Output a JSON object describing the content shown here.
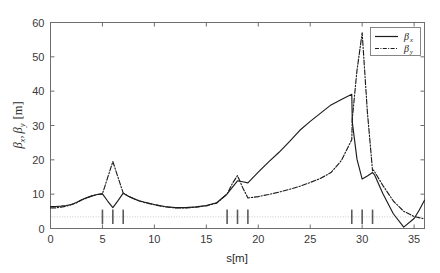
{
  "chart_data": {
    "type": "line",
    "title": "",
    "xlabel": "s[m]",
    "ylabel": "βx, βy [m]",
    "ylabel_parts": {
      "beta": "β",
      "sub_x": "x",
      "sub_y": "y",
      "unit": "[m]",
      "separator": ","
    },
    "xlim": [
      0,
      36
    ],
    "ylim": [
      0,
      60
    ],
    "xticks": [
      0,
      5,
      10,
      15,
      20,
      25,
      30,
      35
    ],
    "xtick_labels": [
      "0",
      "5",
      "10",
      "15",
      "20",
      "25",
      "30",
      "35"
    ],
    "yticks": [
      0,
      10,
      20,
      30,
      40,
      50,
      60
    ],
    "ytick_labels": [
      "0",
      "10",
      "20",
      "30",
      "40",
      "50",
      "60"
    ],
    "grid": false,
    "legend_position": "top-right",
    "legend": [
      {
        "name": "βx",
        "base": "β",
        "sub": "x",
        "style": "solid"
      },
      {
        "name": "βy",
        "base": "β",
        "sub": "y",
        "style": "dash-dot"
      }
    ],
    "reference_line": {
      "y": 3.4,
      "style": "dotted",
      "color": "#c4c4c4"
    },
    "lattice_markers": {
      "label": "magnet-elements",
      "y_center": 3.4,
      "half_height": 2.1,
      "positions": [
        5.0,
        6.0,
        7.0,
        17.0,
        18.0,
        19.0,
        29.0,
        30.0,
        31.0
      ]
    },
    "series": [
      {
        "name": "βx",
        "style": "solid",
        "x": [
          0.0,
          0.5,
          1.0,
          1.5,
          2.0,
          2.5,
          3.0,
          3.5,
          4.0,
          4.5,
          5.0,
          5.5,
          6.0,
          6.5,
          7.0,
          7.5,
          8.0,
          8.5,
          9.0,
          10.0,
          11.0,
          12.0,
          13.0,
          14.0,
          15.0,
          16.0,
          17.0,
          17.5,
          18.0,
          18.5,
          19.0,
          20.0,
          21.0,
          22.0,
          23.0,
          24.0,
          25.0,
          26.0,
          27.0,
          28.0,
          29.0,
          29.05,
          29.5,
          30.0,
          30.5,
          31.0,
          31.2,
          32.0,
          33.0,
          34.0,
          35.0,
          35.5,
          36.0
        ],
        "y": [
          6.4,
          6.4,
          6.5,
          6.7,
          7.0,
          7.6,
          8.4,
          9.0,
          9.5,
          9.9,
          10.1,
          8.0,
          6.1,
          8.1,
          10.3,
          9.4,
          8.7,
          8.1,
          7.7,
          7.0,
          6.4,
          6.1,
          6.1,
          6.3,
          6.7,
          7.5,
          10.1,
          12.0,
          13.9,
          13.6,
          13.3,
          16.4,
          19.4,
          22.2,
          25.3,
          28.6,
          31.2,
          33.6,
          36.0,
          37.6,
          39.1,
          31.0,
          20.2,
          14.4,
          15.3,
          16.3,
          15.6,
          10.1,
          4.3,
          0.4,
          2.9,
          5.4,
          8.2
        ]
      },
      {
        "name": "βy",
        "style": "dash-dot",
        "x": [
          0.0,
          0.5,
          1.0,
          1.5,
          2.0,
          2.5,
          3.0,
          3.5,
          4.0,
          4.5,
          5.0,
          5.5,
          6.0,
          6.5,
          7.0,
          7.5,
          8.0,
          8.5,
          9.0,
          10.0,
          11.0,
          12.0,
          13.0,
          14.0,
          15.0,
          16.0,
          17.0,
          17.5,
          18.0,
          18.5,
          19.0,
          20.0,
          21.0,
          22.0,
          23.0,
          24.0,
          25.0,
          26.0,
          27.0,
          28.0,
          29.0,
          29.05,
          29.5,
          30.0,
          30.5,
          31.0,
          31.1,
          31.5,
          32.0,
          33.0,
          34.0,
          35.0,
          36.0
        ],
        "y": [
          6.0,
          6.0,
          6.2,
          6.5,
          6.9,
          7.5,
          8.3,
          8.9,
          9.5,
          9.9,
          10.1,
          14.8,
          19.5,
          14.9,
          10.3,
          9.4,
          8.7,
          8.1,
          7.6,
          6.9,
          6.3,
          6.0,
          6.0,
          6.2,
          6.6,
          7.4,
          10.0,
          13.1,
          15.4,
          11.9,
          8.9,
          9.3,
          9.9,
          10.6,
          11.4,
          12.3,
          13.4,
          14.6,
          16.3,
          19.8,
          25.9,
          32.0,
          46.0,
          57.0,
          34.0,
          16.8,
          17.0,
          15.0,
          12.5,
          8.0,
          5.0,
          3.5,
          2.8
        ]
      }
    ],
    "annotations": []
  }
}
